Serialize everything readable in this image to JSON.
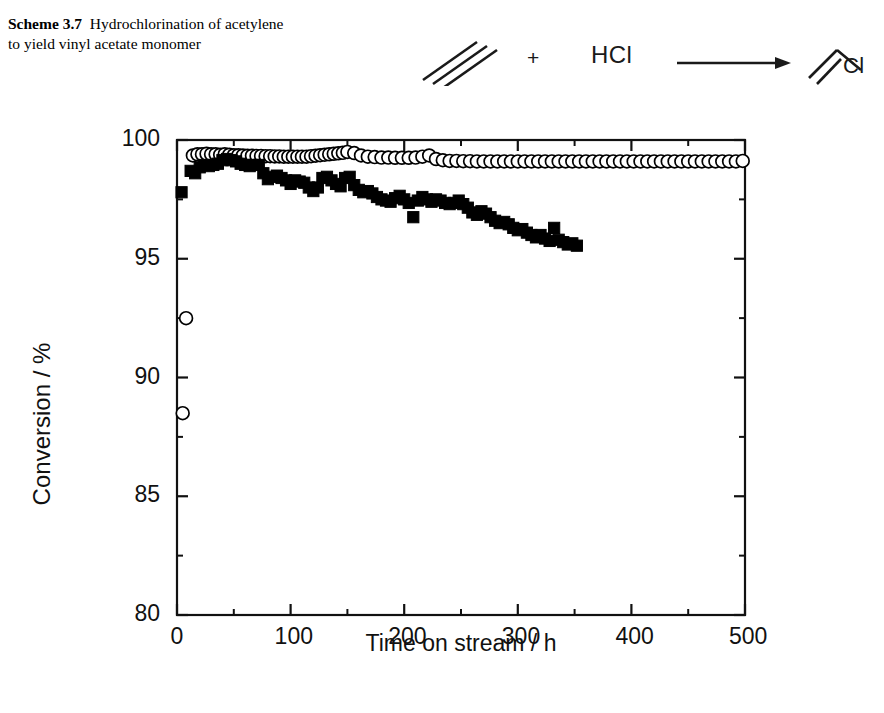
{
  "caption": {
    "scheme_number": "Scheme 3.7",
    "text": "Hydrochlorination of acetylene to yield vinyl acetate monomer"
  },
  "reaction": {
    "reactant_1_name": "acetylene-structure",
    "plus": "+",
    "reactant_2": "HCl",
    "arrow_name": "reaction-arrow",
    "product_name": "vinyl-chloride-structure",
    "product_label": "Cl"
  },
  "chart_data": {
    "type": "scatter",
    "title": "",
    "xlabel": "Time on stream / h",
    "ylabel": "Conversion / %",
    "xlim": [
      0,
      500
    ],
    "ylim": [
      80,
      100
    ],
    "xticks": [
      0,
      100,
      200,
      300,
      400,
      500
    ],
    "xtick_labels": [
      "0",
      "100",
      "200",
      "300",
      "400",
      "500"
    ],
    "yticks": [
      80,
      85,
      90,
      95,
      100
    ],
    "ytick_labels": [
      "80",
      "85",
      "90",
      "95",
      "100"
    ],
    "x_minor_step": 50,
    "y_minor_step": 2.5,
    "grid": false,
    "legend": "none",
    "frame": "box",
    "series": [
      {
        "name": "open-circles",
        "marker": "open-circle",
        "color": "#000000",
        "fill": "#ffffff",
        "points": [
          [
            5,
            88.5
          ],
          [
            8,
            92.5
          ],
          [
            14,
            99.35
          ],
          [
            18,
            99.4
          ],
          [
            22,
            99.4
          ],
          [
            26,
            99.42
          ],
          [
            30,
            99.4
          ],
          [
            34,
            99.4
          ],
          [
            38,
            99.38
          ],
          [
            42,
            99.4
          ],
          [
            46,
            99.38
          ],
          [
            50,
            99.36
          ],
          [
            54,
            99.36
          ],
          [
            58,
            99.35
          ],
          [
            62,
            99.34
          ],
          [
            66,
            99.34
          ],
          [
            70,
            99.33
          ],
          [
            74,
            99.33
          ],
          [
            78,
            99.32
          ],
          [
            82,
            99.32
          ],
          [
            86,
            99.31
          ],
          [
            90,
            99.31
          ],
          [
            94,
            99.3
          ],
          [
            98,
            99.3
          ],
          [
            102,
            99.3
          ],
          [
            106,
            99.3
          ],
          [
            110,
            99.3
          ],
          [
            114,
            99.3
          ],
          [
            118,
            99.32
          ],
          [
            122,
            99.34
          ],
          [
            126,
            99.36
          ],
          [
            130,
            99.38
          ],
          [
            134,
            99.4
          ],
          [
            138,
            99.42
          ],
          [
            142,
            99.44
          ],
          [
            146,
            99.46
          ],
          [
            150,
            99.5
          ],
          [
            156,
            99.45
          ],
          [
            162,
            99.35
          ],
          [
            168,
            99.3
          ],
          [
            174,
            99.28
          ],
          [
            180,
            99.26
          ],
          [
            186,
            99.26
          ],
          [
            192,
            99.25
          ],
          [
            198,
            99.25
          ],
          [
            204,
            99.25
          ],
          [
            210,
            99.26
          ],
          [
            216,
            99.3
          ],
          [
            222,
            99.35
          ],
          [
            228,
            99.2
          ],
          [
            234,
            99.15
          ],
          [
            240,
            99.12
          ],
          [
            246,
            99.12
          ],
          [
            252,
            99.11
          ],
          [
            258,
            99.11
          ],
          [
            264,
            99.1
          ],
          [
            270,
            99.1
          ],
          [
            276,
            99.1
          ],
          [
            282,
            99.1
          ],
          [
            288,
            99.1
          ],
          [
            294,
            99.1
          ],
          [
            300,
            99.1
          ],
          [
            306,
            99.1
          ],
          [
            312,
            99.1
          ],
          [
            318,
            99.1
          ],
          [
            324,
            99.1
          ],
          [
            330,
            99.1
          ],
          [
            336,
            99.1
          ],
          [
            342,
            99.1
          ],
          [
            348,
            99.1
          ],
          [
            354,
            99.1
          ],
          [
            360,
            99.1
          ],
          [
            366,
            99.1
          ],
          [
            372,
            99.1
          ],
          [
            378,
            99.1
          ],
          [
            384,
            99.1
          ],
          [
            390,
            99.1
          ],
          [
            396,
            99.1
          ],
          [
            402,
            99.1
          ],
          [
            408,
            99.1
          ],
          [
            414,
            99.1
          ],
          [
            420,
            99.1
          ],
          [
            426,
            99.1
          ],
          [
            432,
            99.1
          ],
          [
            438,
            99.1
          ],
          [
            444,
            99.1
          ],
          [
            450,
            99.1
          ],
          [
            456,
            99.1
          ],
          [
            462,
            99.1
          ],
          [
            468,
            99.1
          ],
          [
            474,
            99.1
          ],
          [
            480,
            99.1
          ],
          [
            486,
            99.1
          ],
          [
            492,
            99.1
          ],
          [
            498,
            99.12
          ]
        ]
      },
      {
        "name": "filled-squares",
        "marker": "filled-square",
        "color": "#000000",
        "fill": "#000000",
        "points": [
          [
            4,
            97.8
          ],
          [
            12,
            98.7
          ],
          [
            16,
            98.6
          ],
          [
            20,
            98.85
          ],
          [
            24,
            98.95
          ],
          [
            28,
            98.9
          ],
          [
            32,
            98.95
          ],
          [
            36,
            99.0
          ],
          [
            40,
            99.15
          ],
          [
            44,
            99.2
          ],
          [
            48,
            99.15
          ],
          [
            52,
            99.1
          ],
          [
            56,
            99.0
          ],
          [
            60,
            98.95
          ],
          [
            64,
            98.9
          ],
          [
            68,
            98.95
          ],
          [
            72,
            98.95
          ],
          [
            76,
            98.6
          ],
          [
            80,
            98.35
          ],
          [
            84,
            98.45
          ],
          [
            88,
            98.5
          ],
          [
            92,
            98.4
          ],
          [
            96,
            98.3
          ],
          [
            100,
            98.15
          ],
          [
            104,
            98.3
          ],
          [
            108,
            98.25
          ],
          [
            112,
            98.2
          ],
          [
            116,
            98.0
          ],
          [
            120,
            97.85
          ],
          [
            124,
            98.0
          ],
          [
            128,
            98.4
          ],
          [
            132,
            98.45
          ],
          [
            136,
            98.3
          ],
          [
            140,
            98.15
          ],
          [
            144,
            98.05
          ],
          [
            148,
            98.4
          ],
          [
            152,
            98.45
          ],
          [
            156,
            98.1
          ],
          [
            160,
            97.9
          ],
          [
            164,
            97.8
          ],
          [
            168,
            97.85
          ],
          [
            172,
            97.75
          ],
          [
            176,
            97.6
          ],
          [
            180,
            97.5
          ],
          [
            184,
            97.45
          ],
          [
            188,
            97.4
          ],
          [
            192,
            97.55
          ],
          [
            196,
            97.65
          ],
          [
            200,
            97.5
          ],
          [
            204,
            97.35
          ],
          [
            208,
            96.75
          ],
          [
            212,
            97.45
          ],
          [
            216,
            97.6
          ],
          [
            220,
            97.5
          ],
          [
            224,
            97.4
          ],
          [
            228,
            97.5
          ],
          [
            232,
            97.45
          ],
          [
            236,
            97.35
          ],
          [
            240,
            97.3
          ],
          [
            244,
            97.35
          ],
          [
            248,
            97.45
          ],
          [
            252,
            97.3
          ],
          [
            256,
            97.15
          ],
          [
            260,
            96.95
          ],
          [
            264,
            96.85
          ],
          [
            268,
            97.0
          ],
          [
            272,
            96.9
          ],
          [
            276,
            96.75
          ],
          [
            280,
            96.6
          ],
          [
            284,
            96.5
          ],
          [
            288,
            96.55
          ],
          [
            292,
            96.45
          ],
          [
            296,
            96.3
          ],
          [
            300,
            96.2
          ],
          [
            304,
            96.25
          ],
          [
            308,
            96.1
          ],
          [
            312,
            96.0
          ],
          [
            316,
            95.9
          ],
          [
            320,
            96.0
          ],
          [
            324,
            95.85
          ],
          [
            328,
            95.75
          ],
          [
            332,
            96.3
          ],
          [
            336,
            95.8
          ],
          [
            340,
            95.7
          ],
          [
            344,
            95.6
          ],
          [
            348,
            95.65
          ],
          [
            352,
            95.55
          ]
        ]
      }
    ]
  }
}
